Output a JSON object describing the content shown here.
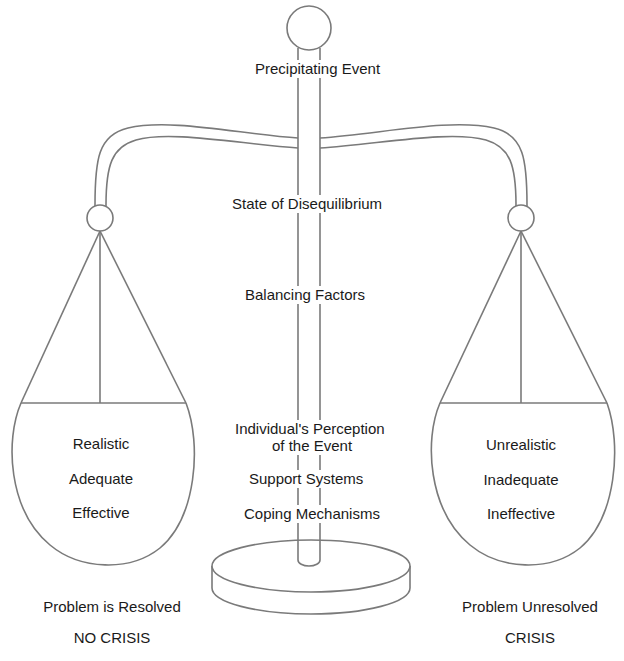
{
  "diagram": {
    "type": "balance-scale",
    "stroke_color": "#7a7a7a",
    "text_color": "#1a1a1a"
  },
  "center_labels": {
    "precipitating_event": "Precipitating Event",
    "state_of_disequilibrium": "State of Disequilibrium",
    "balancing_factors": "Balancing Factors",
    "perception_line1": "Individual's Perception",
    "perception_line2": "of the Event",
    "support_systems": "Support Systems",
    "coping_mechanisms": "Coping Mechanisms"
  },
  "left_pan": {
    "items": [
      "Realistic",
      "Adequate",
      "Effective"
    ],
    "outcome": "Problem is Resolved",
    "result": "NO CRISIS"
  },
  "right_pan": {
    "items": [
      "Unrealistic",
      "Inadequate",
      "Ineffective"
    ],
    "outcome": "Problem Unresolved",
    "result": "CRISIS"
  }
}
